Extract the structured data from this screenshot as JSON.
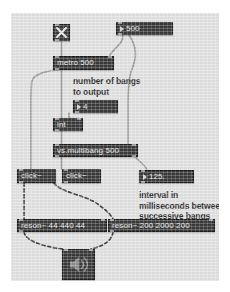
{
  "patch": {
    "title": "vs.multibang patch",
    "canvas_color": "#e2e2e2",
    "object_color": "#3a3a3a",
    "text_color": "#e8e8e8",
    "cable_color": "#9a9a9a",
    "objects": {
      "toggle": {
        "name": "toggle",
        "glyph": "x-mark-icon"
      },
      "metro": {
        "text": "metro 500"
      },
      "interval_numbox": {
        "value": "500"
      },
      "bangs_numbox": {
        "value": "4"
      },
      "int": {
        "text": "int"
      },
      "multibang": {
        "text": "vs.multibang 500"
      },
      "float_numbox": {
        "value": "125."
      },
      "click_left": {
        "text": "click~"
      },
      "click_right": {
        "text": "click~"
      },
      "reson_left": {
        "text": "reson~ 44 440 44"
      },
      "reson_right": {
        "text": "reson~ 200 2000 200"
      },
      "dac": {
        "name": "ezdac",
        "glyph": "speaker-icon"
      }
    },
    "comments": {
      "bangs": "number of bangs\nto output",
      "interval": "interval in\nmilliseconds between\nsuccessive bangs"
    }
  }
}
